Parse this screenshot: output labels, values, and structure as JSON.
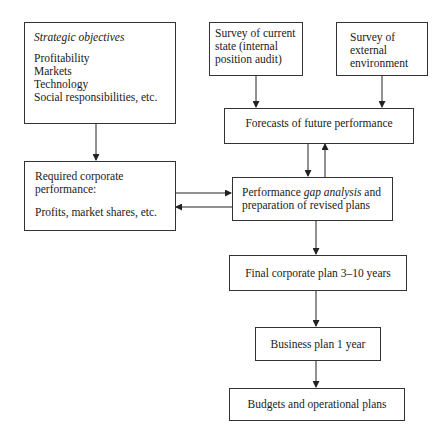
{
  "diagram": {
    "nodes": {
      "strategic_objectives": {
        "title": "Strategic objectives",
        "items": [
          "Profitability",
          "Markets",
          "Technology",
          "Social responsibilities, etc."
        ]
      },
      "survey_current": {
        "lines": [
          "Survey of current",
          "state (internal",
          "position audit)"
        ]
      },
      "survey_external": {
        "lines": [
          "Survey of",
          "external",
          "environment"
        ]
      },
      "forecasts": {
        "label": "Forecasts of future performance"
      },
      "required_performance": {
        "lines": [
          "Required corporate",
          "performance:"
        ],
        "detail": "Profits, market shares, etc."
      },
      "gap_analysis": {
        "line1_prefix": "Performance ",
        "line1_emphasis": "gap analysis",
        "line1_suffix": " and",
        "line2": "preparation of revised plans"
      },
      "final_plan": {
        "label": "Final corporate plan 3–10 years"
      },
      "business_plan": {
        "label": "Business plan 1 year"
      },
      "budgets": {
        "label": "Budgets and operational plans"
      }
    },
    "edges": [
      {
        "from": "strategic_objectives",
        "to": "required_performance"
      },
      {
        "from": "survey_current",
        "to": "forecasts"
      },
      {
        "from": "survey_external",
        "to": "forecasts"
      },
      {
        "from": "forecasts",
        "to": "gap_analysis"
      },
      {
        "from": "gap_analysis",
        "to": "forecasts"
      },
      {
        "from": "required_performance",
        "to": "gap_analysis"
      },
      {
        "from": "gap_analysis",
        "to": "required_performance"
      },
      {
        "from": "gap_analysis",
        "to": "final_plan"
      },
      {
        "from": "final_plan",
        "to": "business_plan"
      },
      {
        "from": "business_plan",
        "to": "budgets"
      }
    ]
  }
}
